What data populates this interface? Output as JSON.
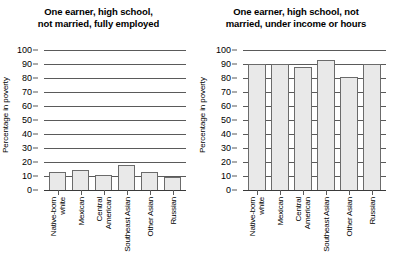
{
  "chart_data": [
    {
      "type": "bar",
      "title": "One earner, high school, not married, fully employed",
      "title_lines": [
        "One earner, high school,",
        "not married, fully employed"
      ],
      "xlabel": "",
      "ylabel": "Percentage in poverty",
      "ylim": [
        0,
        100
      ],
      "yticks": [
        0,
        10,
        20,
        30,
        40,
        50,
        60,
        70,
        80,
        90,
        100
      ],
      "grid": true,
      "legend": "none",
      "categories": [
        "Native-born white",
        "Mexican",
        "Central American",
        "Southeast Asian",
        "Other Asian",
        "Russian"
      ],
      "category_lines": [
        [
          "Native-born",
          "white"
        ],
        [
          "Mexican",
          ""
        ],
        [
          "Central",
          "American"
        ],
        [
          "Southeast Asian",
          ""
        ],
        [
          "Other Asian",
          ""
        ],
        [
          "Russian",
          ""
        ]
      ],
      "values": [
        13,
        14,
        11,
        18,
        13,
        9
      ]
    },
    {
      "type": "bar",
      "title": "One earner, high school, not married, under income or hours",
      "title_lines": [
        "One earner, high school, not",
        "married, under income or hours"
      ],
      "xlabel": "",
      "ylabel": "Percentage in poverty",
      "ylim": [
        0,
        100
      ],
      "yticks": [
        0,
        10,
        20,
        30,
        40,
        50,
        60,
        70,
        80,
        90,
        100
      ],
      "grid": true,
      "legend": "none",
      "categories": [
        "Native-born white",
        "Mexican",
        "Central American",
        "Southeast Asian",
        "Other Asian",
        "Russian"
      ],
      "category_lines": [
        [
          "Native-born",
          "white"
        ],
        [
          "Mexican",
          ""
        ],
        [
          "Central",
          "American"
        ],
        [
          "Southeast Asian",
          ""
        ],
        [
          "Other Asian",
          ""
        ],
        [
          "Russian",
          ""
        ]
      ],
      "values": [
        90,
        90,
        88,
        93,
        81,
        90
      ]
    }
  ],
  "style": {
    "bar_fill": "#e9e9e9",
    "bar_stroke": "#6b6b6b",
    "grid_color": "#5a5a5a",
    "text_color": "#000000",
    "background": "#ffffff"
  }
}
